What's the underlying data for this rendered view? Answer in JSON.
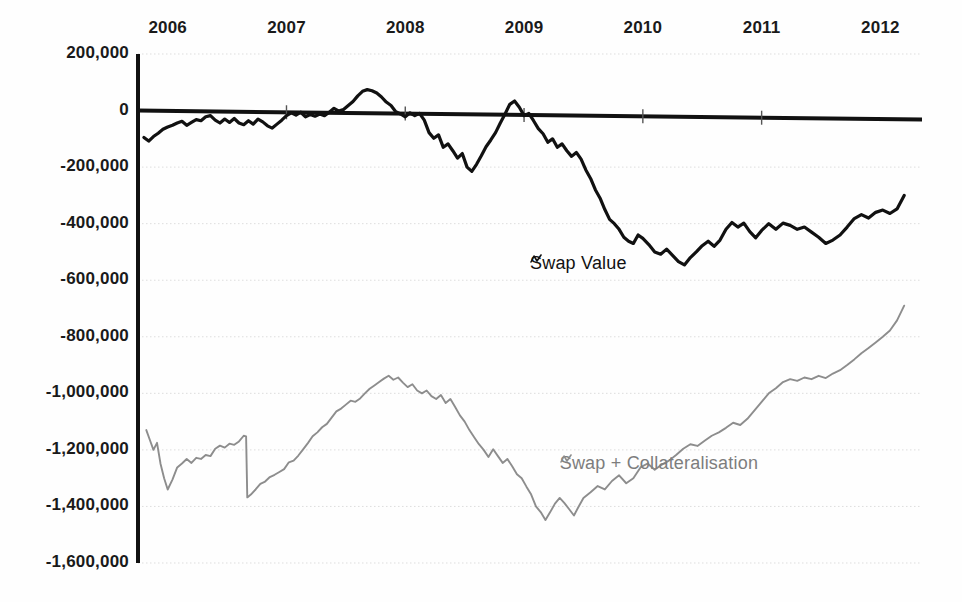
{
  "chart_data": {
    "type": "line",
    "title": "",
    "xlabel": "",
    "ylabel": "",
    "xlim": [
      2005.75,
      2012.35
    ],
    "ylim": [
      -1600000,
      200000
    ],
    "grid": true,
    "legend_position": "inline-annotation",
    "x_tick_labels": [
      "2006",
      "2007",
      "2008",
      "2009",
      "2010",
      "2011",
      "2012"
    ],
    "x_tick_values": [
      2006,
      2007,
      2008,
      2009,
      2010,
      2011,
      2012
    ],
    "y_tick_labels": [
      "200,000",
      "0",
      "-200,000",
      "-400,000",
      "-600,000",
      "-800,000",
      "-1,000,000",
      "-1,200,000",
      "-1,400,000",
      "-1,600,000"
    ],
    "y_tick_values": [
      200000,
      0,
      -200000,
      -400000,
      -600000,
      -800000,
      -1000000,
      -1200000,
      -1400000,
      -1600000
    ],
    "colors": {
      "swap_value": "#111111",
      "swap_collateralisation": "#8d8d8d",
      "axis": "#111111",
      "grid": "#dddddd",
      "background": "#ffffff"
    },
    "series": [
      {
        "name": "Swap Value",
        "color": "#111111",
        "label_x": 2009.05,
        "label_y": -545000,
        "marker": "zigzag",
        "x": [
          2005.8,
          2005.84,
          2005.88,
          2005.92,
          2005.96,
          2006.0,
          2006.04,
          2006.08,
          2006.12,
          2006.16,
          2006.2,
          2006.24,
          2006.28,
          2006.32,
          2006.36,
          2006.4,
          2006.44,
          2006.48,
          2006.52,
          2006.56,
          2006.6,
          2006.64,
          2006.68,
          2006.72,
          2006.76,
          2006.8,
          2006.84,
          2006.88,
          2006.92,
          2006.96,
          2007.0,
          2007.04,
          2007.08,
          2007.12,
          2007.16,
          2007.2,
          2007.24,
          2007.28,
          2007.32,
          2007.36,
          2007.4,
          2007.44,
          2007.48,
          2007.52,
          2007.56,
          2007.6,
          2007.64,
          2007.68,
          2007.72,
          2007.76,
          2007.8,
          2007.84,
          2007.88,
          2007.92,
          2007.96,
          2008.0,
          2008.04,
          2008.08,
          2008.12,
          2008.16,
          2008.2,
          2008.24,
          2008.28,
          2008.32,
          2008.36,
          2008.4,
          2008.44,
          2008.48,
          2008.52,
          2008.56,
          2008.6,
          2008.64,
          2008.68,
          2008.72,
          2008.76,
          2008.8,
          2008.84,
          2008.88,
          2008.92,
          2008.96,
          2009.0,
          2009.04,
          2009.08,
          2009.12,
          2009.16,
          2009.2,
          2009.24,
          2009.28,
          2009.32,
          2009.36,
          2009.4,
          2009.44,
          2009.48,
          2009.52,
          2009.56,
          2009.6,
          2009.64,
          2009.68,
          2009.72,
          2009.76,
          2009.8,
          2009.84,
          2009.88,
          2009.92,
          2009.96,
          2010.0,
          2010.05,
          2010.1,
          2010.15,
          2010.2,
          2010.25,
          2010.3,
          2010.35,
          2010.4,
          2010.45,
          2010.5,
          2010.55,
          2010.6,
          2010.65,
          2010.7,
          2010.75,
          2010.8,
          2010.85,
          2010.9,
          2010.95,
          2011.0,
          2011.06,
          2011.12,
          2011.18,
          2011.24,
          2011.3,
          2011.36,
          2011.42,
          2011.48,
          2011.54,
          2011.6,
          2011.66,
          2011.72,
          2011.78,
          2011.84,
          2011.9,
          2011.96,
          2012.02,
          2012.08,
          2012.14,
          2012.2
        ],
        "y": [
          -95000,
          -108000,
          -92000,
          -80000,
          -66000,
          -58000,
          -52000,
          -44000,
          -38000,
          -52000,
          -42000,
          -32000,
          -36000,
          -22000,
          -18000,
          -34000,
          -44000,
          -30000,
          -42000,
          -28000,
          -44000,
          -50000,
          -36000,
          -48000,
          -30000,
          -40000,
          -54000,
          -62000,
          -48000,
          -34000,
          -18000,
          -8000,
          -16000,
          -6000,
          -22000,
          -14000,
          -20000,
          -12000,
          -18000,
          -6000,
          8000,
          -2000,
          4000,
          18000,
          32000,
          52000,
          68000,
          74000,
          70000,
          62000,
          48000,
          30000,
          18000,
          -4000,
          -12000,
          -22000,
          -8000,
          -18000,
          -10000,
          -34000,
          -78000,
          -98000,
          -86000,
          -130000,
          -118000,
          -142000,
          -168000,
          -152000,
          -200000,
          -215000,
          -190000,
          -160000,
          -128000,
          -104000,
          -78000,
          -44000,
          -12000,
          22000,
          34000,
          12000,
          -18000,
          -10000,
          -36000,
          -64000,
          -82000,
          -112000,
          -100000,
          -130000,
          -118000,
          -142000,
          -162000,
          -148000,
          -172000,
          -210000,
          -240000,
          -280000,
          -310000,
          -350000,
          -385000,
          -400000,
          -420000,
          -448000,
          -462000,
          -470000,
          -440000,
          -452000,
          -474000,
          -500000,
          -508000,
          -490000,
          -512000,
          -534000,
          -546000,
          -520000,
          -500000,
          -478000,
          -462000,
          -480000,
          -458000,
          -420000,
          -396000,
          -412000,
          -398000,
          -428000,
          -450000,
          -424000,
          -400000,
          -420000,
          -398000,
          -406000,
          -420000,
          -412000,
          -430000,
          -448000,
          -470000,
          -458000,
          -440000,
          -412000,
          -382000,
          -368000,
          -380000,
          -360000,
          -352000,
          -364000,
          -348000,
          -300000
        ]
      },
      {
        "name": "Swap + Collateralisation",
        "color": "#8d8d8d",
        "label_x": 2009.3,
        "label_y": -1252000,
        "marker": "zigzag",
        "x": [
          2005.82,
          2005.85,
          2005.88,
          2005.91,
          2005.94,
          2005.97,
          2006.0,
          2006.04,
          2006.08,
          2006.12,
          2006.16,
          2006.2,
          2006.24,
          2006.28,
          2006.32,
          2006.36,
          2006.4,
          2006.44,
          2006.48,
          2006.52,
          2006.56,
          2006.6,
          2006.64,
          2006.66,
          2006.67,
          2006.7,
          2006.74,
          2006.78,
          2006.82,
          2006.86,
          2006.9,
          2006.94,
          2006.98,
          2007.02,
          2007.06,
          2007.1,
          2007.14,
          2007.18,
          2007.22,
          2007.26,
          2007.3,
          2007.34,
          2007.38,
          2007.42,
          2007.46,
          2007.5,
          2007.54,
          2007.58,
          2007.62,
          2007.66,
          2007.7,
          2007.74,
          2007.78,
          2007.82,
          2007.86,
          2007.9,
          2007.94,
          2007.98,
          2008.02,
          2008.06,
          2008.1,
          2008.14,
          2008.18,
          2008.22,
          2008.26,
          2008.3,
          2008.34,
          2008.38,
          2008.42,
          2008.46,
          2008.5,
          2008.54,
          2008.58,
          2008.62,
          2008.66,
          2008.7,
          2008.74,
          2008.78,
          2008.82,
          2008.86,
          2008.9,
          2008.94,
          2008.98,
          2009.02,
          2009.06,
          2009.1,
          2009.14,
          2009.18,
          2009.22,
          2009.26,
          2009.3,
          2009.34,
          2009.38,
          2009.42,
          2009.46,
          2009.5,
          2009.56,
          2009.62,
          2009.68,
          2009.74,
          2009.8,
          2009.86,
          2009.92,
          2009.98,
          2010.04,
          2010.1,
          2010.16,
          2010.22,
          2010.28,
          2010.34,
          2010.4,
          2010.46,
          2010.52,
          2010.58,
          2010.64,
          2010.7,
          2010.76,
          2010.82,
          2010.88,
          2010.94,
          2011.0,
          2011.06,
          2011.12,
          2011.18,
          2011.24,
          2011.3,
          2011.36,
          2011.42,
          2011.48,
          2011.54,
          2011.6,
          2011.66,
          2011.72,
          2011.78,
          2011.84,
          2011.9,
          2011.96,
          2012.02,
          2012.08,
          2012.14,
          2012.2
        ],
        "y": [
          -1130000,
          -1165000,
          -1200000,
          -1175000,
          -1250000,
          -1300000,
          -1340000,
          -1305000,
          -1262000,
          -1248000,
          -1232000,
          -1246000,
          -1228000,
          -1232000,
          -1218000,
          -1222000,
          -1196000,
          -1185000,
          -1192000,
          -1178000,
          -1182000,
          -1170000,
          -1150000,
          -1152000,
          -1368000,
          -1358000,
          -1340000,
          -1320000,
          -1312000,
          -1296000,
          -1288000,
          -1278000,
          -1268000,
          -1244000,
          -1238000,
          -1220000,
          -1198000,
          -1176000,
          -1152000,
          -1138000,
          -1120000,
          -1108000,
          -1086000,
          -1064000,
          -1054000,
          -1040000,
          -1026000,
          -1030000,
          -1018000,
          -1000000,
          -984000,
          -972000,
          -960000,
          -948000,
          -938000,
          -952000,
          -944000,
          -962000,
          -978000,
          -968000,
          -990000,
          -1000000,
          -990000,
          -1010000,
          -1020000,
          -1006000,
          -1034000,
          -1020000,
          -1048000,
          -1078000,
          -1100000,
          -1130000,
          -1155000,
          -1180000,
          -1200000,
          -1225000,
          -1198000,
          -1222000,
          -1246000,
          -1232000,
          -1258000,
          -1286000,
          -1300000,
          -1330000,
          -1358000,
          -1400000,
          -1420000,
          -1448000,
          -1420000,
          -1390000,
          -1370000,
          -1388000,
          -1410000,
          -1432000,
          -1400000,
          -1370000,
          -1350000,
          -1328000,
          -1340000,
          -1310000,
          -1290000,
          -1318000,
          -1300000,
          -1262000,
          -1248000,
          -1270000,
          -1252000,
          -1238000,
          -1218000,
          -1196000,
          -1180000,
          -1186000,
          -1168000,
          -1150000,
          -1138000,
          -1122000,
          -1104000,
          -1112000,
          -1090000,
          -1060000,
          -1030000,
          -1000000,
          -982000,
          -960000,
          -950000,
          -956000,
          -944000,
          -950000,
          -938000,
          -946000,
          -930000,
          -918000,
          -900000,
          -880000,
          -858000,
          -840000,
          -820000,
          -800000,
          -778000,
          -742000,
          -690000
        ]
      }
    ]
  },
  "legend": {
    "swap_value": "Swap Value",
    "swap_collateralisation": "Swap + Collateralisation"
  }
}
